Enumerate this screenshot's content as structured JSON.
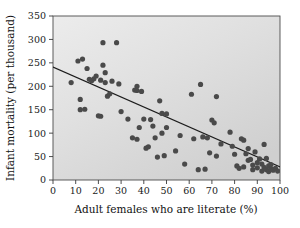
{
  "chart_data": {
    "type": "scatter",
    "title": "",
    "xlabel": "Adult females who are literate (%)",
    "ylabel": "Infant mortality (per thousand)",
    "xlim": [
      0,
      100
    ],
    "ylim": [
      0,
      350
    ],
    "xticks": [
      0,
      10,
      20,
      30,
      40,
      50,
      60,
      70,
      80,
      90,
      100
    ],
    "yticks": [
      0,
      50,
      100,
      150,
      200,
      250,
      300,
      350
    ],
    "xtick_labels": [
      "0",
      "10",
      "20",
      "30",
      "40",
      "50",
      "60",
      "70",
      "80",
      "90",
      "100"
    ],
    "ytick_labels": [
      "0",
      "50",
      "100",
      "150",
      "200",
      "250",
      "300",
      "350"
    ],
    "grid": false,
    "legend": "none",
    "marker_color": "#4a4a4a",
    "marker_size": 2.6,
    "plot_background": "#d8d8d8",
    "plot_background_light": "#ebebeb",
    "border_color": "#4c4c4c",
    "trendline": {
      "label": "fitted regression line",
      "color": "#1c1c1c",
      "x_start": 0,
      "y_start": 241,
      "x_end": 100,
      "y_end": 28
    },
    "points": [
      [
        8,
        208
      ],
      [
        11,
        254
      ],
      [
        12,
        172
      ],
      [
        12,
        150
      ],
      [
        13,
        258
      ],
      [
        14,
        151
      ],
      [
        15,
        238
      ],
      [
        16,
        215
      ],
      [
        17,
        212
      ],
      [
        18,
        216
      ],
      [
        19,
        222
      ],
      [
        20,
        137
      ],
      [
        21,
        136
      ],
      [
        21,
        213
      ],
      [
        22,
        293
      ],
      [
        22,
        245
      ],
      [
        23,
        229
      ],
      [
        23,
        208
      ],
      [
        24,
        179
      ],
      [
        25,
        184
      ],
      [
        26,
        211
      ],
      [
        28,
        293
      ],
      [
        29,
        205
      ],
      [
        30,
        146
      ],
      [
        33,
        130
      ],
      [
        35,
        90
      ],
      [
        36,
        192
      ],
      [
        37,
        200
      ],
      [
        37,
        191
      ],
      [
        37,
        87
      ],
      [
        38,
        112
      ],
      [
        39,
        189
      ],
      [
        40,
        130
      ],
      [
        41,
        68
      ],
      [
        42,
        71
      ],
      [
        43,
        129
      ],
      [
        44,
        115
      ],
      [
        45,
        90
      ],
      [
        46,
        49
      ],
      [
        47,
        169
      ],
      [
        48,
        142
      ],
      [
        48,
        100
      ],
      [
        49,
        52
      ],
      [
        50,
        141
      ],
      [
        50,
        112
      ],
      [
        54,
        62
      ],
      [
        56,
        95
      ],
      [
        58,
        34
      ],
      [
        61,
        183
      ],
      [
        62,
        88
      ],
      [
        64,
        22
      ],
      [
        65,
        204
      ],
      [
        66,
        92
      ],
      [
        67,
        23
      ],
      [
        68,
        90
      ],
      [
        69,
        58
      ],
      [
        70,
        128
      ],
      [
        71,
        122
      ],
      [
        72,
        178
      ],
      [
        72,
        51
      ],
      [
        74,
        77
      ],
      [
        78,
        102
      ],
      [
        79,
        72
      ],
      [
        80,
        55
      ],
      [
        81,
        30
      ],
      [
        82,
        25
      ],
      [
        83,
        88
      ],
      [
        84,
        85
      ],
      [
        84,
        28
      ],
      [
        85,
        56
      ],
      [
        86,
        67
      ],
      [
        86,
        42
      ],
      [
        87,
        44
      ],
      [
        88,
        22
      ],
      [
        88,
        32
      ],
      [
        89,
        60
      ],
      [
        90,
        37
      ],
      [
        90,
        26
      ],
      [
        91,
        45
      ],
      [
        92,
        19
      ],
      [
        92,
        34
      ],
      [
        93,
        76
      ],
      [
        93,
        27
      ],
      [
        94,
        46
      ],
      [
        94,
        22
      ],
      [
        95,
        30
      ],
      [
        95,
        18
      ],
      [
        96,
        24
      ],
      [
        96,
        33
      ],
      [
        97,
        21
      ],
      [
        98,
        25
      ],
      [
        99,
        19
      ]
    ]
  }
}
